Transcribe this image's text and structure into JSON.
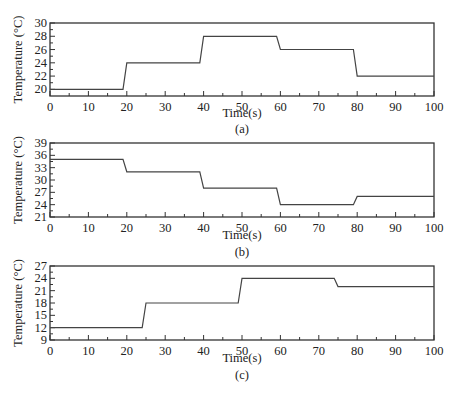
{
  "chart_data": [
    {
      "id": "a",
      "type": "line",
      "title": "",
      "caption": "(a)",
      "xlabel": "Time(s)",
      "ylabel": "Temperature (°C)",
      "xlim": [
        0,
        100
      ],
      "ylim": [
        19,
        30
      ],
      "xticks": [
        0,
        10,
        20,
        30,
        40,
        50,
        60,
        70,
        80,
        90,
        100
      ],
      "yticks": [
        20,
        22,
        24,
        26,
        28,
        30
      ],
      "grid": false,
      "legend": null,
      "series": [
        {
          "name": "temperature",
          "x": [
            0,
            19,
            20,
            39,
            40,
            59,
            60,
            79,
            80,
            100
          ],
          "y": [
            20,
            20,
            24,
            24,
            28,
            28,
            26,
            26,
            22,
            22
          ]
        }
      ]
    },
    {
      "id": "b",
      "type": "line",
      "title": "",
      "caption": "(b)",
      "xlabel": "Time(s)",
      "ylabel": "Temperature (°C)",
      "xlim": [
        0,
        100
      ],
      "ylim": [
        21,
        39
      ],
      "xticks": [
        0,
        10,
        20,
        30,
        40,
        50,
        60,
        70,
        80,
        90,
        100
      ],
      "yticks": [
        21,
        24,
        27,
        30,
        33,
        36,
        39
      ],
      "grid": false,
      "legend": null,
      "series": [
        {
          "name": "temperature",
          "x": [
            0,
            19,
            20,
            39,
            40,
            59,
            60,
            79,
            80,
            100
          ],
          "y": [
            35,
            35,
            32,
            32,
            28,
            28,
            24,
            24,
            26,
            26
          ]
        }
      ]
    },
    {
      "id": "c",
      "type": "line",
      "title": "",
      "caption": "(c)",
      "xlabel": "Time(s)",
      "ylabel": "Temperature (°C)",
      "xlim": [
        0,
        100
      ],
      "ylim": [
        9,
        27
      ],
      "xticks": [
        0,
        10,
        20,
        30,
        40,
        50,
        60,
        70,
        80,
        90,
        100
      ],
      "yticks": [
        9,
        12,
        15,
        18,
        21,
        24,
        27
      ],
      "grid": false,
      "legend": null,
      "series": [
        {
          "name": "temperature",
          "x": [
            0,
            24,
            25,
            49,
            50,
            74,
            75,
            100
          ],
          "y": [
            12,
            12,
            18,
            18,
            24,
            24,
            22,
            22
          ]
        }
      ]
    }
  ],
  "layout": [
    {
      "box": {
        "left": 50,
        "right": 434,
        "top": 23,
        "bottom": 96
      },
      "xlabel_y": 117,
      "caption_y": 133
    },
    {
      "box": {
        "left": 50,
        "right": 434,
        "top": 143,
        "bottom": 217
      },
      "xlabel_y": 239,
      "caption_y": 256
    },
    {
      "box": {
        "left": 50,
        "right": 434,
        "top": 266,
        "bottom": 340
      },
      "xlabel_y": 362,
      "caption_y": 379
    }
  ]
}
